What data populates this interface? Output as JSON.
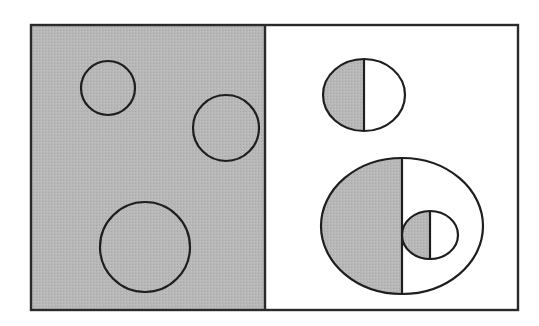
{
  "colors": {
    "background": "#ffffff",
    "shade": "#b7b7b7",
    "stroke": "#1e1e1e"
  },
  "diagram": {
    "frame": {
      "x": 31,
      "y": 25,
      "width": 487,
      "height": 285
    },
    "divider_x": 265,
    "left_panel": {
      "fill": "shaded",
      "circles": [
        {
          "cx": 108,
          "cy": 88,
          "r": 27
        },
        {
          "cx": 226,
          "cy": 128,
          "r": 33
        },
        {
          "cx": 145,
          "cy": 247,
          "r": 45
        }
      ]
    },
    "right_panel": {
      "fill": "white",
      "half_shaded_shapes": [
        {
          "name": "top-split-circle",
          "cx": 364,
          "cy": 95,
          "rx": 41,
          "ry": 36,
          "split_x": 364
        },
        {
          "name": "large-split-ellipse",
          "cx": 402,
          "cy": 226,
          "rx": 81,
          "ry": 68,
          "split_x": 402
        },
        {
          "name": "inner-split-circle",
          "cx": 430,
          "cy": 235,
          "rx": 28,
          "ry": 24,
          "split_x": 430
        }
      ]
    }
  }
}
